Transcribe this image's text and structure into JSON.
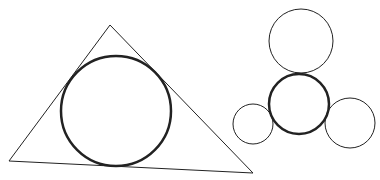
{
  "diagram": {
    "background": "#ffffff",
    "stroke_color": "#222222",
    "triangle": {
      "points": "110,25 9,161 253,173",
      "stroke_width": 1
    },
    "incircle": {
      "cx": 116,
      "cy": 111,
      "r": 55,
      "stroke_width": 2.5
    },
    "cluster": {
      "center": {
        "cx": 299,
        "cy": 104,
        "r": 30,
        "stroke_width": 2.5
      },
      "top": {
        "cx": 301,
        "cy": 41,
        "r": 32,
        "stroke_width": 1
      },
      "left": {
        "cx": 253,
        "cy": 124,
        "r": 20,
        "stroke_width": 1
      },
      "right": {
        "cx": 350,
        "cy": 123,
        "r": 25,
        "stroke_width": 1
      }
    }
  }
}
